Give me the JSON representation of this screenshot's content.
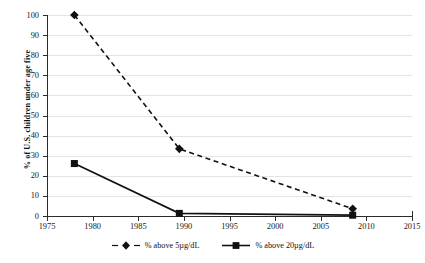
{
  "chart_data": {
    "type": "line",
    "title": "",
    "xlabel": "",
    "ylabel": "% of U.S. children under age five",
    "xlim": [
      1975,
      2015
    ],
    "ylim": [
      0,
      100
    ],
    "xticks": [
      1975,
      1980,
      1985,
      1990,
      1995,
      2000,
      2005,
      2010,
      2015
    ],
    "yticks": [
      0,
      10,
      20,
      30,
      40,
      50,
      60,
      70,
      80,
      90,
      100
    ],
    "grid": "horizontal",
    "legend_position": "bottom",
    "series": [
      {
        "name": "% above 5µg/dL",
        "marker": "diamond",
        "linestyle": "dashed",
        "color": "#111111",
        "x": [
          1978,
          1989.5,
          2008.5
        ],
        "values": [
          100,
          33.4,
          3.6
        ]
      },
      {
        "name": "% above 20µg/dL",
        "marker": "square",
        "linestyle": "solid",
        "color": "#111111",
        "x": [
          1978,
          1989.5,
          2008.5
        ],
        "values": [
          26.1,
          1.3,
          0.4
        ]
      }
    ]
  },
  "axis": {
    "y_title": "% of U.S. children under age five",
    "y_tick_labels": [
      "0",
      "10",
      "20",
      "30",
      "40",
      "50",
      "60",
      "70",
      "80",
      "90",
      "100"
    ],
    "x_tick_labels": [
      "1975",
      "1980",
      "1985",
      "1990",
      "1995",
      "2000",
      "2005",
      "2010",
      "2015"
    ]
  },
  "legend": {
    "items": [
      {
        "label": "% above 5µg/dL",
        "marker": "diamond",
        "linestyle": "dashed"
      },
      {
        "label": "% above 20µg/dL",
        "marker": "square",
        "linestyle": "solid"
      }
    ]
  },
  "colors": {
    "ink": "#111111",
    "axis": "#2b2b2b",
    "gridline": "#e4e4e4",
    "background": "#ffffff"
  }
}
